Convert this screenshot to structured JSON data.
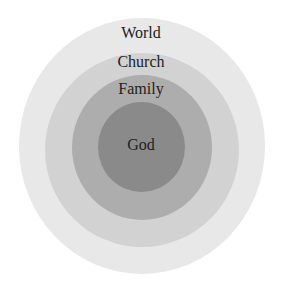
{
  "diagram": {
    "type": "concentric-circles",
    "rings": [
      {
        "label": "World",
        "color": "#e6e6e6"
      },
      {
        "label": "Church",
        "color": "#cfcfcf"
      },
      {
        "label": "Family",
        "color": "#a9a9a9"
      },
      {
        "label": "God",
        "color": "#888888"
      }
    ]
  }
}
